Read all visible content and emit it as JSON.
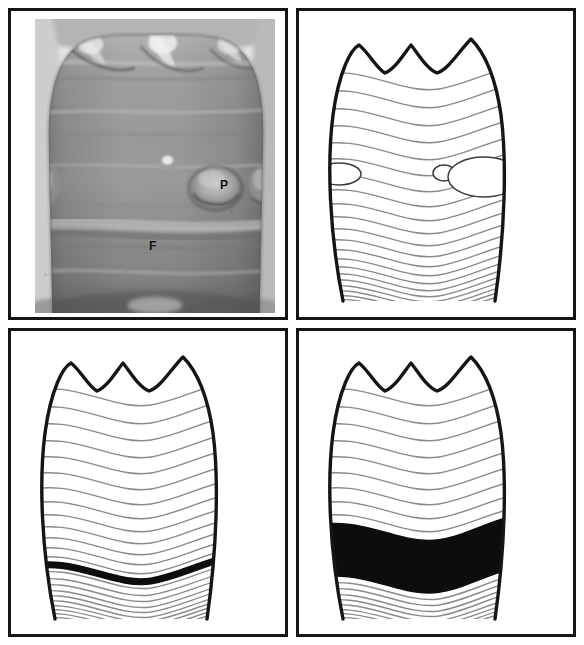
{
  "figure": {
    "background_color": "#ffffff",
    "frame_color": "#151515",
    "grid": {
      "rows": 2,
      "columns": 2
    }
  },
  "panels": [
    {
      "id": "a",
      "position": "top-left",
      "type": "photograph",
      "subject": "anterior tooth crown labial surface",
      "description": "Grayscale clinical macrophotograph of a tooth crown showing three incisal mamelons, a circular pit defect and a horizontal furrow defect",
      "labels": [
        {
          "key": "pit",
          "text": "P",
          "meaning": "pit-form defect",
          "x": 185,
          "y": 160
        },
        {
          "key": "furrow",
          "text": "F",
          "meaning": "furrow-form defect",
          "x": 114,
          "y": 221
        }
      ],
      "tones": {
        "enamel_mid": "#8d8d8d",
        "enamel_light": "#b9b9b9",
        "enamel_dark": "#5c5c5c",
        "highlight": "#e8e8e8",
        "background": "#f2f2f2"
      }
    },
    {
      "id": "b",
      "position": "top-right",
      "type": "schematic",
      "defect_type": "pit-form",
      "description": "Line drawing of a tooth crown with perikymata growth lines and four elliptical pits arranged along one growth increment",
      "outline_color": "#151515",
      "perikymata_color": "#8a8a8a",
      "pit_outline_color": "#3a3a3a",
      "pits": [
        {
          "cx": 14,
          "cy": 163,
          "rx": 22,
          "ry": 11,
          "name": "pit-left-marginal"
        },
        {
          "cx": 145,
          "cy": 162,
          "rx": 11,
          "ry": 8,
          "name": "pit-small-central"
        },
        {
          "cx": 185,
          "cy": 166,
          "rx": 36,
          "ry": 20,
          "name": "pit-large"
        },
        {
          "cx": 244,
          "cy": 166,
          "rx": 19,
          "ry": 14,
          "name": "pit-right-marginal"
        }
      ],
      "perikymata_count": 26,
      "mamelon_count": 3
    },
    {
      "id": "c",
      "position": "bottom-left",
      "type": "schematic",
      "defect_type": "furrow-form",
      "description": "Line drawing of a tooth crown with perikymata growth lines and one accentuated thick dark horizontal furrow in the cervical third",
      "outline_color": "#151515",
      "perikymata_color": "#8a8a8a",
      "defect_color": "#0d0d0d",
      "defect_band": {
        "center_y_fraction": 0.665,
        "thickness_px": 7,
        "name": "furrow-line"
      },
      "perikymata_count": 26,
      "mamelon_count": 3
    },
    {
      "id": "d",
      "position": "bottom-right",
      "type": "schematic",
      "defect_type": "plane-form",
      "description": "Line drawing of a tooth crown with perikymata growth lines and a broad solid black band of missing enamel across the cervical third",
      "outline_color": "#151515",
      "perikymata_color": "#8a8a8a",
      "defect_color": "#0d0d0d",
      "defect_band": {
        "top_y_fraction": 0.575,
        "bottom_y_fraction": 0.755,
        "name": "plane-band"
      },
      "perikymata_count": 26,
      "mamelon_count": 3
    }
  ],
  "legend": {
    "p": "P",
    "f": "F",
    "p_meaning": "pit",
    "f_meaning": "furrow"
  }
}
